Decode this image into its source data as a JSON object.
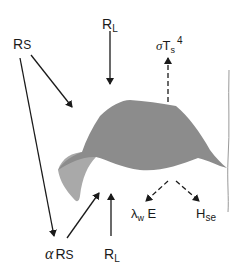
{
  "diagram": {
    "colors": {
      "leaf_upper": "#8c8c8c",
      "leaf_underside": "#a9a9a9",
      "stem": "#9a9a9a",
      "arrow": "#1a1a1a",
      "background": "#ffffff"
    },
    "labels": {
      "shortwave_in": {
        "main": "R",
        "sub": "S"
      },
      "longwave_top": {
        "main": "R",
        "sub": "L"
      },
      "emitted": {
        "sigma": "σ",
        "main": "T",
        "sub": "s",
        "sup": "4"
      },
      "reflected": {
        "alpha": "α",
        "main": "R",
        "sub": "S"
      },
      "longwave_bottom": {
        "main": "R",
        "sub": "L"
      },
      "latent_heat": {
        "lambda": "λ",
        "sub": "w",
        "main": " E"
      },
      "sensible_heat": {
        "main": "H",
        "sub": "se"
      }
    },
    "arrows": [
      {
        "name": "shortwave-to-leaf",
        "from": "R_S",
        "to": "leaf",
        "style": "solid"
      },
      {
        "name": "shortwave-to-ground",
        "from": "R_S",
        "to": "alpha R_S",
        "style": "solid"
      },
      {
        "name": "longwave-down",
        "from": "R_L (top)",
        "to": "leaf",
        "style": "solid"
      },
      {
        "name": "emission-up",
        "from": "leaf",
        "to": "sigma T_s^4",
        "style": "dashed"
      },
      {
        "name": "reflected-up",
        "from": "alpha R_S",
        "to": "leaf",
        "style": "solid"
      },
      {
        "name": "longwave-up",
        "from": "R_L (bottom)",
        "to": "leaf",
        "style": "solid"
      },
      {
        "name": "latent-heat-out",
        "from": "leaf",
        "to": "lambda_w E",
        "style": "dashed"
      },
      {
        "name": "sensible-heat-out",
        "from": "leaf",
        "to": "H_se",
        "style": "dashed"
      }
    ]
  }
}
